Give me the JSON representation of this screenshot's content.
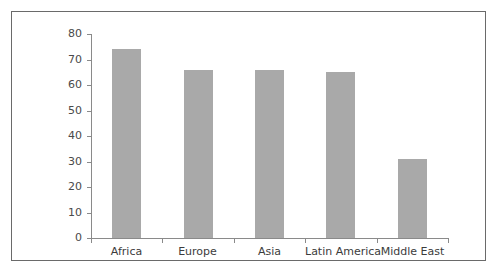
{
  "chart_data": {
    "type": "bar",
    "title": "",
    "subtitle": "",
    "xlabel": "",
    "ylabel": "",
    "categories": [
      "Africa",
      "Europe",
      "Asia",
      "Latin America",
      "Middle East"
    ],
    "values": [
      74,
      66,
      66,
      65,
      31
    ],
    "ylim": [
      0,
      80
    ],
    "y_ticks": [
      0,
      10,
      20,
      30,
      40,
      50,
      60,
      70,
      80
    ],
    "y_tick_labels": [
      "0",
      "10",
      "20",
      "30",
      "40",
      "50",
      "60",
      "70",
      "80"
    ],
    "grid": false,
    "legend": null,
    "legend_position": "none",
    "annotations": [],
    "colors": {
      "bar_fill": "#a9a9a9",
      "axis": "#8a8a8a",
      "frame_border": "#6a6a6a",
      "background": "#ffffff",
      "tick_label": "#4a4a4a",
      "category_label": "#3c3c3c"
    }
  }
}
